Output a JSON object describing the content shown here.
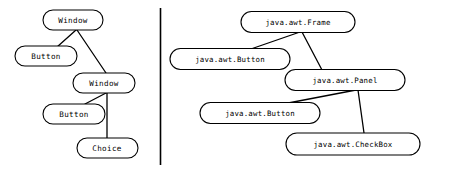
{
  "diagram": {
    "background_color": "#ffffff",
    "stroke_color": "#000000",
    "divider": {
      "label": "vertical-divider",
      "x": 160,
      "y1": 8,
      "y2": 165
    },
    "panels": [
      {
        "id": "left",
        "name": "short-class-names-graph",
        "nodes": [
          {
            "id": "L1",
            "label": "Window",
            "cx": 73,
            "cy": 20,
            "w": 60,
            "h": 20
          },
          {
            "id": "L2",
            "label": "Button",
            "cx": 46,
            "cy": 56,
            "w": 62,
            "h": 20
          },
          {
            "id": "L3",
            "label": "Window",
            "cx": 104,
            "cy": 83,
            "w": 62,
            "h": 20
          },
          {
            "id": "L4",
            "label": "Button",
            "cx": 74,
            "cy": 114,
            "w": 62,
            "h": 20
          },
          {
            "id": "L5",
            "label": "Choice",
            "cx": 107,
            "cy": 148,
            "w": 61,
            "h": 20
          }
        ],
        "edges": [
          {
            "from": "L1",
            "to": "L2",
            "x1": 76,
            "y1": 30,
            "x2": 57,
            "y2": 47
          },
          {
            "from": "L1",
            "to": "L3",
            "x1": 77,
            "y1": 30,
            "x2": 106,
            "y2": 73
          },
          {
            "from": "L3",
            "to": "L4",
            "x1": 106,
            "y1": 93,
            "x2": 85,
            "y2": 104
          },
          {
            "from": "L3",
            "to": "L5",
            "x1": 107,
            "y1": 93,
            "x2": 107,
            "y2": 138
          }
        ]
      },
      {
        "id": "right",
        "name": "qualified-class-names-graph",
        "nodes": [
          {
            "id": "R1",
            "label": "java.awt.Frame",
            "cx": 298,
            "cy": 22,
            "w": 114,
            "h": 21
          },
          {
            "id": "R2",
            "label": "java.awt.Button",
            "cx": 230,
            "cy": 59,
            "w": 120,
            "h": 21
          },
          {
            "id": "R3",
            "label": "java.awt.Panel",
            "cx": 345,
            "cy": 80,
            "w": 120,
            "h": 21
          },
          {
            "id": "R4",
            "label": "java.awt.Button",
            "cx": 260,
            "cy": 113,
            "w": 120,
            "h": 21
          },
          {
            "id": "R5",
            "label": "java.awt.CheckBox",
            "cx": 353,
            "cy": 144,
            "w": 134,
            "h": 22
          }
        ],
        "edges": [
          {
            "from": "R1",
            "to": "R2",
            "x1": 300,
            "y1": 32,
            "x2": 248,
            "y2": 50
          },
          {
            "from": "R1",
            "to": "R3",
            "x1": 302,
            "y1": 32,
            "x2": 322,
            "y2": 70
          },
          {
            "from": "R3",
            "to": "R4",
            "x1": 356,
            "y1": 90,
            "x2": 283,
            "y2": 104
          },
          {
            "from": "R3",
            "to": "R5",
            "x1": 358,
            "y1": 90,
            "x2": 364,
            "y2": 133
          }
        ]
      }
    ]
  }
}
